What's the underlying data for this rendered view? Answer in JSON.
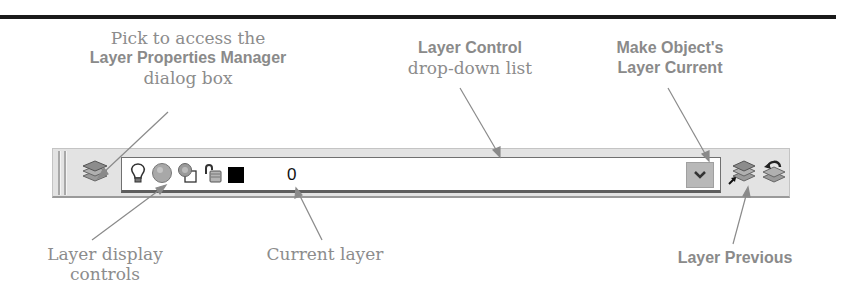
{
  "callouts": {
    "layer_properties": {
      "line1": "Pick to access the",
      "line2": "Layer Properties Manager",
      "line3": "dialog box"
    },
    "layer_control": {
      "line1": "Layer Control",
      "line2": "drop-down list"
    },
    "make_current": {
      "line1": "Make Object's",
      "line2": "Layer Current"
    },
    "display_controls": {
      "line1": "Layer display",
      "line2": "controls"
    },
    "current_layer": {
      "line1": "Current layer"
    },
    "layer_previous": {
      "line1": "Layer Previous"
    }
  },
  "toolbar": {
    "buttons": [
      {
        "name": "layer-properties-manager",
        "icon": "layer-stack-icon"
      },
      {
        "name": "make-objects-layer-current",
        "icon": "layer-stack-arrow-icon"
      },
      {
        "name": "layer-previous",
        "icon": "layer-previous-icon"
      }
    ],
    "layer_control": {
      "current_layer": "0",
      "controls": [
        {
          "name": "on-off",
          "icon": "lightbulb-icon"
        },
        {
          "name": "freeze-thaw-all-viewports",
          "icon": "sun-icon"
        },
        {
          "name": "freeze-thaw-current-viewport",
          "icon": "viewport-sun-icon"
        },
        {
          "name": "lock-unlock",
          "icon": "padlock-icon"
        },
        {
          "name": "color",
          "icon": "color-swatch",
          "value": "#000000"
        }
      ],
      "dropdown_icon": "chevron-down-icon"
    }
  },
  "colors": {
    "callout_text": "#8c8c8c",
    "leader_line": "#8a8a8a",
    "toolbar_bg": "#e3e3e3",
    "rule": "#1a1a1a"
  }
}
